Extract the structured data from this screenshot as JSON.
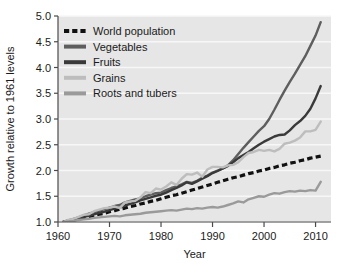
{
  "chart_data": {
    "type": "line",
    "title": "",
    "xlabel": "Year",
    "ylabel": "Growth relative to 1961 levels",
    "xlim": [
      1960,
      2013
    ],
    "ylim": [
      1.0,
      5.0
    ],
    "grid": true,
    "legend_position": "top-left",
    "xticks": [
      1960,
      1970,
      1980,
      1990,
      2000,
      2010
    ],
    "xtick_labels": [
      "1960",
      "1970",
      "1980",
      "1990",
      "2000",
      "2010"
    ],
    "yticks": [
      1.0,
      1.5,
      2.0,
      2.5,
      3.0,
      3.5,
      4.0,
      4.5,
      5.0
    ],
    "ytick_labels": [
      "1.0",
      "1.5",
      "2.0",
      "2.5",
      "3.0",
      "3.5",
      "4.0",
      "4.5",
      "5.0"
    ],
    "x": [
      1961,
      1962,
      1963,
      1964,
      1965,
      1966,
      1967,
      1968,
      1969,
      1970,
      1971,
      1972,
      1973,
      1974,
      1975,
      1976,
      1977,
      1978,
      1979,
      1980,
      1981,
      1982,
      1983,
      1984,
      1985,
      1986,
      1987,
      1988,
      1989,
      1990,
      1991,
      1992,
      1993,
      1994,
      1995,
      1996,
      1997,
      1998,
      1999,
      2000,
      2001,
      2002,
      2003,
      2004,
      2005,
      2006,
      2007,
      2008,
      2009,
      2010,
      2011
    ],
    "series": [
      {
        "name": "World population",
        "color": "#111111",
        "style": "dashed",
        "width": 3.2,
        "values": [
          1.0,
          1.02,
          1.04,
          1.06,
          1.08,
          1.1,
          1.13,
          1.15,
          1.17,
          1.2,
          1.22,
          1.25,
          1.27,
          1.3,
          1.32,
          1.35,
          1.37,
          1.4,
          1.42,
          1.45,
          1.48,
          1.51,
          1.53,
          1.56,
          1.59,
          1.62,
          1.65,
          1.68,
          1.71,
          1.74,
          1.77,
          1.8,
          1.83,
          1.86,
          1.88,
          1.91,
          1.94,
          1.96,
          1.99,
          2.01,
          2.04,
          2.06,
          2.09,
          2.11,
          2.14,
          2.16,
          2.19,
          2.21,
          2.24,
          2.26,
          2.28
        ]
      },
      {
        "name": "Vegetables",
        "color": "#5e5e5e",
        "style": "solid",
        "width": 2.4,
        "values": [
          1.0,
          1.03,
          1.06,
          1.09,
          1.13,
          1.16,
          1.19,
          1.22,
          1.25,
          1.28,
          1.31,
          1.33,
          1.38,
          1.41,
          1.44,
          1.46,
          1.5,
          1.53,
          1.56,
          1.57,
          1.62,
          1.66,
          1.69,
          1.73,
          1.78,
          1.76,
          1.8,
          1.86,
          1.9,
          1.96,
          2.0,
          2.04,
          2.1,
          2.2,
          2.32,
          2.44,
          2.55,
          2.66,
          2.77,
          2.86,
          3.0,
          3.18,
          3.37,
          3.55,
          3.72,
          3.88,
          4.05,
          4.22,
          4.42,
          4.62,
          4.88
        ]
      },
      {
        "name": "Fruits",
        "color": "#3a3a3a",
        "style": "solid",
        "width": 2.4,
        "values": [
          1.0,
          1.02,
          1.05,
          1.07,
          1.1,
          1.12,
          1.15,
          1.18,
          1.2,
          1.23,
          1.26,
          1.28,
          1.32,
          1.35,
          1.38,
          1.42,
          1.45,
          1.48,
          1.51,
          1.53,
          1.57,
          1.62,
          1.66,
          1.71,
          1.77,
          1.74,
          1.79,
          1.84,
          1.89,
          1.95,
          1.99,
          2.04,
          2.09,
          2.16,
          2.24,
          2.3,
          2.36,
          2.43,
          2.5,
          2.56,
          2.61,
          2.66,
          2.69,
          2.7,
          2.78,
          2.88,
          2.96,
          3.06,
          3.2,
          3.4,
          3.64
        ]
      },
      {
        "name": "Grains",
        "color": "#bdbdbd",
        "style": "solid",
        "width": 2.4,
        "values": [
          1.0,
          1.04,
          1.06,
          1.1,
          1.14,
          1.15,
          1.21,
          1.24,
          1.27,
          1.28,
          1.3,
          1.27,
          1.38,
          1.4,
          1.41,
          1.48,
          1.58,
          1.56,
          1.65,
          1.63,
          1.69,
          1.77,
          1.72,
          1.84,
          1.93,
          1.92,
          1.96,
          1.88,
          2.02,
          2.07,
          2.07,
          2.06,
          2.1,
          2.11,
          2.16,
          2.26,
          2.34,
          2.36,
          2.4,
          2.38,
          2.4,
          2.37,
          2.42,
          2.52,
          2.54,
          2.58,
          2.64,
          2.76,
          2.76,
          2.79,
          2.95
        ]
      },
      {
        "name": "Roots and tubers",
        "color": "#9a9a9a",
        "style": "solid",
        "width": 2.4,
        "values": [
          1.0,
          1.01,
          1.02,
          1.04,
          1.05,
          1.06,
          1.08,
          1.09,
          1.1,
          1.11,
          1.12,
          1.11,
          1.13,
          1.14,
          1.15,
          1.16,
          1.18,
          1.19,
          1.2,
          1.21,
          1.22,
          1.23,
          1.22,
          1.24,
          1.26,
          1.25,
          1.27,
          1.26,
          1.28,
          1.29,
          1.28,
          1.3,
          1.33,
          1.36,
          1.4,
          1.38,
          1.44,
          1.47,
          1.5,
          1.49,
          1.53,
          1.56,
          1.55,
          1.58,
          1.6,
          1.59,
          1.61,
          1.6,
          1.62,
          1.61,
          1.78
        ]
      }
    ]
  },
  "legend": {
    "items": [
      {
        "label": "World population"
      },
      {
        "label": "Vegetables"
      },
      {
        "label": "Fruits"
      },
      {
        "label": "Grains"
      },
      {
        "label": "Roots and tubers"
      }
    ]
  },
  "colors": {
    "plot_background": "#e6e6e6",
    "gridline": "#f7f7f7",
    "axis": "#4a4a4a",
    "text": "#1a1a1a",
    "page_background": "#ffffff"
  },
  "caption": {
    "text": ""
  }
}
